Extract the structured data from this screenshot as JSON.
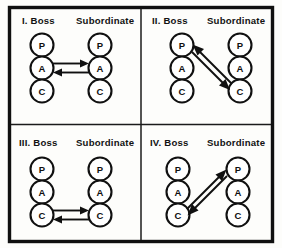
{
  "figure": {
    "background_color": "#fdfdfb",
    "ink_color": "#101010",
    "frame": {
      "outer_border_color": "#101010",
      "divider_color": "#1b1b1b"
    }
  },
  "column_headers": {
    "boss": "Boss",
    "subordinate": "Subordinate"
  },
  "ego_states": {
    "parent": "P",
    "adult": "A",
    "child": "C"
  },
  "panels": [
    {
      "id": "panel-1",
      "numeral": "I.",
      "title_left": "I.  Boss",
      "title_right": "Subordinate",
      "boss_nodes": [
        "P",
        "A",
        "C"
      ],
      "subordinate_nodes": [
        "P",
        "A",
        "C"
      ],
      "transactions": [
        {
          "name": "adult-to-adult-outbound",
          "from_side": "boss",
          "from_state": "A",
          "to_side": "subordinate",
          "to_state": "A",
          "direction": "right",
          "style": "horizontal"
        },
        {
          "name": "adult-to-adult-inbound",
          "from_side": "subordinate",
          "from_state": "A",
          "to_side": "boss",
          "to_state": "A",
          "direction": "left",
          "style": "horizontal"
        }
      ]
    },
    {
      "id": "panel-2",
      "numeral": "II.",
      "title_left": "II.  Boss",
      "title_right": "Subordinate",
      "boss_nodes": [
        "P",
        "A",
        "C"
      ],
      "subordinate_nodes": [
        "P",
        "A",
        "C"
      ],
      "transactions": [
        {
          "name": "parent-to-child-outbound",
          "from_side": "boss",
          "from_state": "P",
          "to_side": "subordinate",
          "to_state": "C",
          "direction": "down-right",
          "style": "diagonal"
        },
        {
          "name": "child-to-parent-inbound",
          "from_side": "subordinate",
          "from_state": "C",
          "to_side": "boss",
          "to_state": "P",
          "direction": "up-left",
          "style": "diagonal"
        }
      ]
    },
    {
      "id": "panel-3",
      "numeral": "III.",
      "title_left": "III.  Boss",
      "title_right": "Subordinate",
      "boss_nodes": [
        "P",
        "A",
        "C"
      ],
      "subordinate_nodes": [
        "P",
        "A",
        "C"
      ],
      "transactions": [
        {
          "name": "child-to-child-outbound",
          "from_side": "boss",
          "from_state": "C",
          "to_side": "subordinate",
          "to_state": "C",
          "direction": "right",
          "style": "horizontal"
        },
        {
          "name": "child-to-child-inbound",
          "from_side": "subordinate",
          "from_state": "C",
          "to_side": "boss",
          "to_state": "C",
          "direction": "left",
          "style": "horizontal"
        }
      ]
    },
    {
      "id": "panel-4",
      "numeral": "IV.",
      "title_left": "IV.  Boss",
      "title_right": "Subordinate",
      "boss_nodes": [
        "P",
        "A",
        "C"
      ],
      "subordinate_nodes": [
        "P",
        "A",
        "C"
      ],
      "transactions": [
        {
          "name": "child-to-parent-outbound",
          "from_side": "boss",
          "from_state": "C",
          "to_side": "subordinate",
          "to_state": "P",
          "direction": "up-right",
          "style": "diagonal"
        },
        {
          "name": "parent-to-child-inbound",
          "from_side": "subordinate",
          "from_state": "P",
          "to_side": "boss",
          "to_state": "C",
          "direction": "down-left",
          "style": "diagonal"
        }
      ]
    }
  ]
}
